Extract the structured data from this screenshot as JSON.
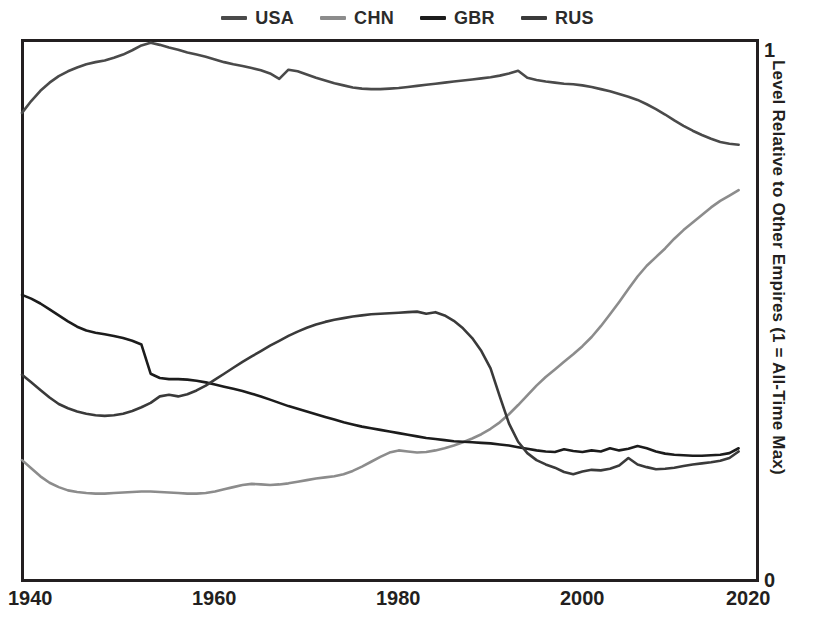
{
  "legend": {
    "position": "top-center",
    "entries": [
      {
        "name": "USA",
        "color": "#4a4a4a"
      },
      {
        "name": "CHN",
        "color": "#8c8c8c"
      },
      {
        "name": "GBR",
        "color": "#1c1c1c"
      },
      {
        "name": "RUS",
        "color": "#3a3a3a"
      }
    ]
  },
  "axes": {
    "x_ticks": [
      "1940",
      "1960",
      "1980",
      "2000",
      "2020"
    ],
    "y_ticks_top": "1",
    "y_ticks_bottom": "0",
    "y_label": "Level Relative to Other Empires (1 = All-Time Max)"
  },
  "chart_data": {
    "type": "line",
    "title": "",
    "xlabel": "",
    "ylabel": "Level Relative to Other Empires (1 = All-Time Max)",
    "xlim": [
      1940,
      2020
    ],
    "ylim": [
      0,
      1
    ],
    "xticks": [
      1940,
      1960,
      1980,
      2000,
      2020
    ],
    "yticks": [
      0,
      1
    ],
    "grid": false,
    "legend_position": "top-center",
    "x": [
      1940,
      1941,
      1942,
      1943,
      1944,
      1945,
      1946,
      1947,
      1948,
      1949,
      1950,
      1951,
      1952,
      1953,
      1954,
      1955,
      1956,
      1957,
      1958,
      1959,
      1960,
      1961,
      1962,
      1963,
      1964,
      1965,
      1966,
      1967,
      1968,
      1969,
      1970,
      1971,
      1972,
      1973,
      1974,
      1975,
      1976,
      1977,
      1978,
      1979,
      1980,
      1981,
      1982,
      1983,
      1984,
      1985,
      1986,
      1987,
      1988,
      1989,
      1990,
      1991,
      1992,
      1993,
      1994,
      1995,
      1996,
      1997,
      1998,
      1999,
      2000,
      2001,
      2002,
      2003,
      2004,
      2005,
      2006,
      2007,
      2008,
      2009,
      2010,
      2011,
      2012,
      2013,
      2014,
      2015,
      2016,
      2017,
      2018
    ],
    "series": [
      {
        "name": "USA",
        "color": "#4a4a4a",
        "values": [
          0.865,
          0.887,
          0.906,
          0.921,
          0.933,
          0.942,
          0.949,
          0.955,
          0.959,
          0.962,
          0.967,
          0.973,
          0.981,
          0.99,
          0.995,
          0.991,
          0.986,
          0.982,
          0.977,
          0.973,
          0.969,
          0.964,
          0.959,
          0.955,
          0.952,
          0.948,
          0.944,
          0.938,
          0.928,
          0.945,
          0.942,
          0.936,
          0.93,
          0.925,
          0.92,
          0.916,
          0.912,
          0.91,
          0.909,
          0.909,
          0.91,
          0.911,
          0.913,
          0.915,
          0.917,
          0.919,
          0.921,
          0.923,
          0.925,
          0.927,
          0.929,
          0.931,
          0.934,
          0.938,
          0.943,
          0.93,
          0.926,
          0.923,
          0.921,
          0.919,
          0.918,
          0.916,
          0.913,
          0.909,
          0.905,
          0.9,
          0.895,
          0.889,
          0.881,
          0.872,
          0.862,
          0.851,
          0.841,
          0.832,
          0.824,
          0.817,
          0.811,
          0.808,
          0.806
        ]
      },
      {
        "name": "CHN",
        "color": "#8c8c8c",
        "values": [
          0.222,
          0.207,
          0.192,
          0.18,
          0.172,
          0.166,
          0.163,
          0.161,
          0.16,
          0.16,
          0.161,
          0.162,
          0.163,
          0.164,
          0.164,
          0.163,
          0.162,
          0.161,
          0.16,
          0.16,
          0.161,
          0.164,
          0.168,
          0.172,
          0.176,
          0.178,
          0.177,
          0.176,
          0.177,
          0.179,
          0.182,
          0.185,
          0.188,
          0.19,
          0.192,
          0.196,
          0.202,
          0.21,
          0.219,
          0.228,
          0.236,
          0.24,
          0.238,
          0.236,
          0.237,
          0.24,
          0.244,
          0.249,
          0.255,
          0.262,
          0.27,
          0.28,
          0.292,
          0.307,
          0.324,
          0.342,
          0.36,
          0.376,
          0.39,
          0.404,
          0.418,
          0.433,
          0.45,
          0.47,
          0.492,
          0.515,
          0.539,
          0.562,
          0.582,
          0.598,
          0.614,
          0.632,
          0.648,
          0.662,
          0.676,
          0.69,
          0.702,
          0.712,
          0.722
        ]
      },
      {
        "name": "GBR",
        "color": "#1c1c1c",
        "values": [
          0.528,
          0.521,
          0.512,
          0.501,
          0.49,
          0.479,
          0.469,
          0.462,
          0.458,
          0.455,
          0.452,
          0.448,
          0.443,
          0.436,
          0.382,
          0.374,
          0.372,
          0.372,
          0.371,
          0.369,
          0.366,
          0.362,
          0.358,
          0.354,
          0.35,
          0.345,
          0.34,
          0.334,
          0.328,
          0.322,
          0.317,
          0.312,
          0.307,
          0.302,
          0.297,
          0.292,
          0.288,
          0.284,
          0.281,
          0.278,
          0.275,
          0.272,
          0.269,
          0.266,
          0.263,
          0.261,
          0.259,
          0.257,
          0.256,
          0.255,
          0.254,
          0.253,
          0.251,
          0.249,
          0.246,
          0.243,
          0.24,
          0.238,
          0.237,
          0.242,
          0.239,
          0.237,
          0.24,
          0.238,
          0.244,
          0.24,
          0.243,
          0.248,
          0.244,
          0.238,
          0.234,
          0.232,
          0.231,
          0.23,
          0.23,
          0.231,
          0.232,
          0.235,
          0.244
        ]
      },
      {
        "name": "RUS",
        "color": "#3a3a3a",
        "values": [
          0.38,
          0.366,
          0.352,
          0.338,
          0.326,
          0.318,
          0.312,
          0.308,
          0.305,
          0.304,
          0.305,
          0.308,
          0.313,
          0.32,
          0.328,
          0.34,
          0.343,
          0.34,
          0.344,
          0.351,
          0.36,
          0.371,
          0.382,
          0.393,
          0.404,
          0.414,
          0.424,
          0.434,
          0.443,
          0.452,
          0.46,
          0.467,
          0.473,
          0.478,
          0.482,
          0.485,
          0.488,
          0.49,
          0.492,
          0.493,
          0.494,
          0.495,
          0.496,
          0.497,
          0.493,
          0.496,
          0.49,
          0.48,
          0.466,
          0.448,
          0.424,
          0.392,
          0.34,
          0.29,
          0.256,
          0.235,
          0.222,
          0.214,
          0.208,
          0.2,
          0.196,
          0.201,
          0.204,
          0.203,
          0.206,
          0.212,
          0.226,
          0.214,
          0.209,
          0.205,
          0.206,
          0.208,
          0.211,
          0.214,
          0.216,
          0.218,
          0.221,
          0.226,
          0.238
        ]
      }
    ]
  }
}
